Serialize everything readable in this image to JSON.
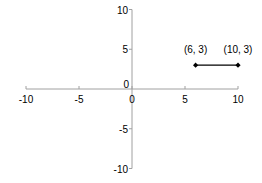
{
  "chart_data": {
    "type": "line",
    "title": "",
    "xlabel": "",
    "ylabel": "",
    "xlim": [
      -10,
      10
    ],
    "ylim": [
      -10,
      10
    ],
    "grid": false,
    "legend": null,
    "x_ticks": [
      -10,
      -5,
      0,
      5,
      10
    ],
    "y_ticks": [
      -10,
      -5,
      0,
      5,
      10
    ],
    "x_tick_labels": [
      "-10",
      "-5",
      "0",
      "5",
      "10"
    ],
    "y_tick_labels": [
      "-10",
      "-5",
      "0",
      "5",
      "10"
    ],
    "series": [
      {
        "name": "segment",
        "x": [
          6,
          10
        ],
        "y": [
          3,
          3
        ],
        "marker": "diamond",
        "color": "#000000"
      }
    ],
    "annotations": [
      {
        "text": "(6, 3)",
        "x": 6,
        "y": 3
      },
      {
        "text": "(10, 3)",
        "x": 10,
        "y": 3
      }
    ]
  },
  "colors": {
    "axis": "#a0a0a0",
    "line": "#000000",
    "text": "#000000"
  }
}
